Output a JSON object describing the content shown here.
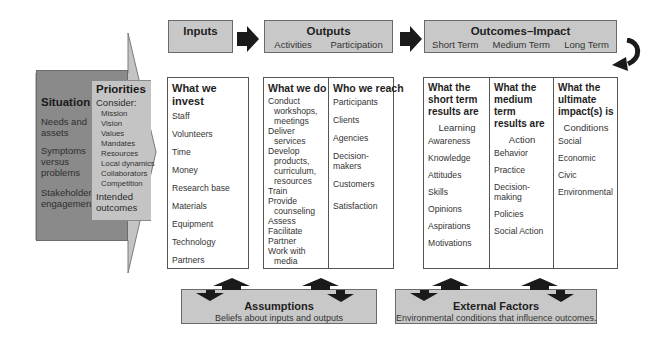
{
  "header": {
    "inputs": {
      "title": "Inputs"
    },
    "outputs": {
      "title": "Outputs",
      "subs": [
        "Activities",
        "Participation"
      ]
    },
    "outcomes": {
      "title": "Outcomes–Impact",
      "subs": [
        "Short Term",
        "Medium Term",
        "Long Term"
      ]
    }
  },
  "situation": {
    "title": "Situation",
    "items": [
      "Needs and assets",
      "Symptoms versus problems",
      "Stakeholder engagement"
    ]
  },
  "priorities": {
    "title": "Priorities",
    "consider": "Consider:",
    "items": [
      "Mission",
      "Vision",
      "Values",
      "Mandates",
      "Resources",
      "Local dynamics",
      "Collaborators",
      "Competition"
    ],
    "intended": "Intended outcomes"
  },
  "inputs_col": {
    "heading": "What we invest",
    "items": [
      "Staff",
      "Volunteers",
      "Time",
      "Money",
      "Research base",
      "Materials",
      "Equipment",
      "Technology",
      "Partners"
    ]
  },
  "outputs_col": {
    "activities": {
      "heading": "What we do",
      "items": [
        {
          "first": "Conduct",
          "rest": [
            "workshops,",
            "meetings"
          ]
        },
        {
          "first": "Deliver",
          "rest": [
            "services"
          ]
        },
        {
          "first": "Develop",
          "rest": [
            "products,",
            "curriculum,",
            "resources"
          ]
        },
        {
          "first": "Train",
          "rest": []
        },
        {
          "first": "Provide",
          "rest": [
            "counseling"
          ]
        },
        {
          "first": "Assess",
          "rest": []
        },
        {
          "first": "Facilitate",
          "rest": []
        },
        {
          "first": "Partner",
          "rest": []
        },
        {
          "first": "Work with",
          "rest": [
            "media"
          ]
        }
      ]
    },
    "participation": {
      "heading": "Who we reach",
      "items": [
        "Participants",
        "Clients",
        "Agencies",
        "Decision-makers",
        "Customers",
        "Satisfaction"
      ]
    }
  },
  "outcomes_col": {
    "short": {
      "heading": "What the short term results are",
      "sub": "Learning",
      "items": [
        "Awareness",
        "Knowledge",
        "Attitudes",
        "Skills",
        "Opinions",
        "Aspirations",
        "Motivations"
      ]
    },
    "medium": {
      "heading": "What the medium term results are",
      "sub": "Action",
      "items": [
        "Behavior",
        "Practice",
        "Decision-making",
        "Policies",
        "Social Action"
      ]
    },
    "long": {
      "heading": "What the ultimate impact(s) is",
      "sub": "Conditions",
      "items": [
        "Social",
        "Economic",
        "Civic",
        "Environmental"
      ]
    }
  },
  "assumptions": {
    "title": "Assumptions",
    "desc": "Beliefs about inputs and outputs"
  },
  "external": {
    "title": "External Factors",
    "desc": "Environmental conditions that influence outcomes."
  },
  "colors": {
    "header_fill": "#c8c8c8",
    "situation_fill": "#8a8a8a",
    "priorities_fill": "#c4c4c4",
    "arrow_fill": "#1a1a1a"
  }
}
